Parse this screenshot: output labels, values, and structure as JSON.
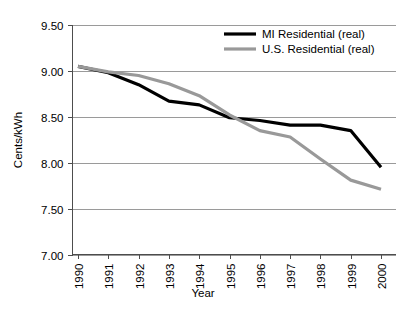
{
  "chart_data": {
    "type": "line",
    "title": "",
    "xlabel": "Year",
    "ylabel": "Cents/kWh",
    "x": [
      1990,
      1991,
      1992,
      1993,
      1994,
      1995,
      1996,
      1997,
      1998,
      1999,
      2000
    ],
    "categories": [
      "1990",
      "1991",
      "1992",
      "1993",
      "1994",
      "1995",
      "1996",
      "1997",
      "1998",
      "1999",
      "2000"
    ],
    "xlim": [
      1990,
      2000
    ],
    "ylim": [
      7.0,
      9.5
    ],
    "yticks": [
      "9.50",
      "9.00",
      "8.50",
      "8.00",
      "7.50",
      "7.00"
    ],
    "ytick_values": [
      9.5,
      9.0,
      8.5,
      8.0,
      7.5,
      7.0
    ],
    "grid": true,
    "legend_position": "top-right",
    "series": [
      {
        "name": "MI Residential (real)",
        "color": "#000000",
        "line_width": 3.2,
        "values": [
          9.05,
          8.98,
          8.85,
          8.67,
          8.63,
          8.49,
          8.46,
          8.41,
          8.41,
          8.35,
          7.95
        ]
      },
      {
        "name": "U.S. Residential (real)",
        "color": "#999999",
        "line_width": 3.2,
        "values": [
          9.05,
          8.99,
          8.95,
          8.86,
          8.73,
          8.52,
          8.35,
          8.28,
          8.04,
          7.81,
          7.71
        ]
      }
    ]
  },
  "colors": {
    "series_mi": "#000000",
    "series_us": "#999999",
    "gridline": "#9a9a9a",
    "axis": "#4d4d4d",
    "background": "#ffffff",
    "text": "#000000"
  }
}
